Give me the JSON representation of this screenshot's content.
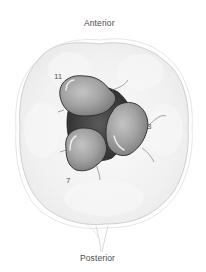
{
  "diagram": {
    "type": "anatomical-cross-section",
    "labels": {
      "top": "Anterior",
      "bottom": "Posterior"
    },
    "lobes": [
      {
        "label": "11",
        "position": "upper-left"
      },
      {
        "label": "3",
        "position": "right"
      },
      {
        "label": "7",
        "position": "lower-left"
      }
    ],
    "colors": {
      "background": "#ffffff",
      "outer_tissue": "#f2f2f2",
      "outline": "#c8c8c8",
      "lobe_fill": "#9a9a9a",
      "lobe_highlight": "#d8d8d8",
      "central_gap": "#3a3a3a",
      "lobe_outline": "#2a2a2a",
      "text": "#4a4a4a"
    }
  }
}
